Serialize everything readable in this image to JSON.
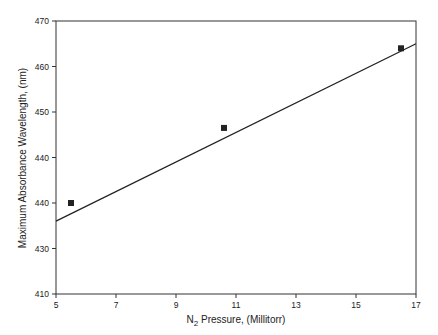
{
  "chart_data": {
    "type": "scatter",
    "title": "",
    "xlabel": "N2 Pressure, (Millitorr)",
    "xlabel_main": "N",
    "xlabel_sub": "2",
    "xlabel_rest": " Pressure, (Millitorr)",
    "ylabel": "Maximum Absorbance Wavelength, (nm)",
    "xlim": [
      5,
      17
    ],
    "ylim": [
      410,
      470
    ],
    "x_ticks": [
      5,
      7,
      9,
      11,
      13,
      15,
      17
    ],
    "y_ticks": [
      410,
      420,
      430,
      440,
      450,
      460,
      470
    ],
    "y_tick_labels": [
      "410",
      "430",
      "440",
      "440",
      "450",
      "460",
      "470"
    ],
    "grid": false,
    "legend": null,
    "series": [
      {
        "name": "Measured",
        "marker": "square",
        "points": [
          {
            "x": 5.5,
            "y": 430
          },
          {
            "x": 10.6,
            "y": 446.5
          },
          {
            "x": 16.5,
            "y": 464
          }
        ]
      },
      {
        "name": "Linear fit",
        "style": "line",
        "points": [
          {
            "x": 5,
            "y": 426
          },
          {
            "x": 17,
            "y": 465
          }
        ]
      }
    ]
  }
}
